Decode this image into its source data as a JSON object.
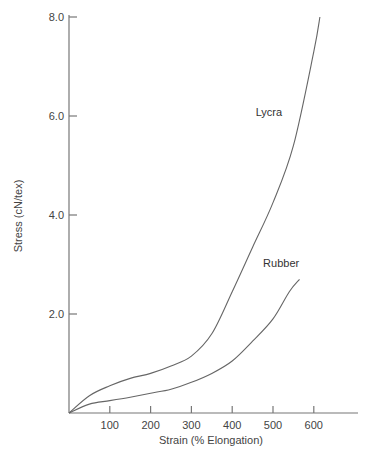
{
  "chart_data": {
    "type": "line",
    "title": "",
    "xlabel": "Strain (% Elongation)",
    "ylabel": "Stress (cN/tex)",
    "xlim": [
      0,
      700
    ],
    "ylim": [
      0,
      8.0
    ],
    "x_ticks": [
      100,
      200,
      300,
      400,
      500,
      600
    ],
    "x_tick_labels": [
      "100",
      "200",
      "300",
      "400",
      "500",
      "600"
    ],
    "y_ticks": [
      2.0,
      4.0,
      6.0,
      8.0
    ],
    "y_tick_labels": [
      "2.0",
      "4.0",
      "6.0",
      "8.0"
    ],
    "grid": false,
    "legend": "inline labels",
    "series": [
      {
        "name": "Lycra",
        "x": [
          0,
          50,
          100,
          150,
          200,
          250,
          300,
          350,
          400,
          450,
          500,
          550,
          600,
          615
        ],
        "values": [
          0,
          0.35,
          0.55,
          0.7,
          0.8,
          0.95,
          1.15,
          1.6,
          2.45,
          3.35,
          4.25,
          5.4,
          7.3,
          8.0
        ],
        "label_pos": [
          490,
          6.0
        ]
      },
      {
        "name": "Rubber",
        "x": [
          0,
          50,
          100,
          150,
          200,
          250,
          300,
          350,
          400,
          450,
          500,
          540,
          565
        ],
        "values": [
          0,
          0.18,
          0.25,
          0.32,
          0.4,
          0.48,
          0.62,
          0.8,
          1.05,
          1.45,
          1.9,
          2.45,
          2.7
        ],
        "label_pos": [
          520,
          2.95
        ]
      }
    ]
  }
}
